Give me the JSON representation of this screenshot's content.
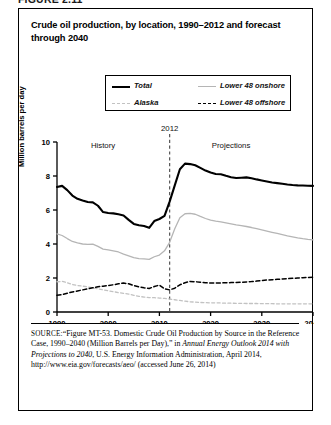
{
  "figure_label": "FIGURE 2.11",
  "title": "Crude oil production, by location, 1990–2012 and forecast through 2040",
  "legend": {
    "items": [
      {
        "label": "Total",
        "style": "solid-thick-black",
        "color": "#000000"
      },
      {
        "label": "Lower 48 onshore",
        "style": "solid-thin-gray",
        "color": "#b5b5b5"
      },
      {
        "label": "Alaska",
        "style": "dashed-light-gray",
        "color": "#c2c2c2"
      },
      {
        "label": "Lower 48 offshore",
        "style": "dashed-black",
        "color": "#000000"
      }
    ]
  },
  "annotations": {
    "history": "History",
    "projections": "Projections",
    "divider_year": "2012"
  },
  "source": {
    "prefix": "SOURCE:",
    "part1": "“Figure MT-53. Domestic Crude Oil Production by Source in the Reference Case, 1990–2040 (Million Barrels per Day),” in ",
    "italic1": "Annual Energy Outlook 2014 with Projections to 2040",
    "part2": ", U.S. Energy Information Administration, April 2014, http://www.eia.gov/forecasts/aeo/ (accessed June 26, 2014)"
  },
  "chart_data": {
    "type": "line",
    "title": "Crude oil production, by location, 1990–2012 and forecast through 2040",
    "xlabel": "",
    "ylabel": "Million barrels per day",
    "xlim": [
      1990,
      2040
    ],
    "ylim": [
      0,
      10
    ],
    "xticks": [
      1990,
      2000,
      2010,
      2020,
      2030,
      2040
    ],
    "yticks": [
      0,
      2,
      4,
      6,
      8,
      10
    ],
    "grid": false,
    "legend_position": "top",
    "vline": {
      "x": 2012,
      "label": "2012",
      "style": "dashed"
    },
    "x": [
      1990,
      1991,
      1992,
      1993,
      1994,
      1995,
      1996,
      1997,
      1998,
      1999,
      2000,
      2001,
      2002,
      2003,
      2004,
      2005,
      2006,
      2007,
      2008,
      2009,
      2010,
      2011,
      2012,
      2013,
      2014,
      2015,
      2016,
      2017,
      2018,
      2019,
      2020,
      2021,
      2022,
      2023,
      2024,
      2025,
      2026,
      2027,
      2028,
      2029,
      2030,
      2031,
      2032,
      2033,
      2034,
      2035,
      2036,
      2037,
      2038,
      2039,
      2040
    ],
    "series": [
      {
        "name": "Total",
        "color": "#000000",
        "style": "solid",
        "width": 2.1,
        "values": [
          7.35,
          7.42,
          7.17,
          6.85,
          6.66,
          6.56,
          6.47,
          6.45,
          6.25,
          5.88,
          5.82,
          5.8,
          5.75,
          5.68,
          5.42,
          5.18,
          5.1,
          5.06,
          4.95,
          5.35,
          5.47,
          5.65,
          6.49,
          7.45,
          8.4,
          8.73,
          8.7,
          8.63,
          8.48,
          8.32,
          8.2,
          8.12,
          8.1,
          8.01,
          7.93,
          7.88,
          7.9,
          7.92,
          7.87,
          7.8,
          7.74,
          7.68,
          7.62,
          7.58,
          7.54,
          7.5,
          7.47,
          7.45,
          7.44,
          7.43,
          7.42
        ]
      },
      {
        "name": "Lower 48 onshore",
        "color": "#b5b5b5",
        "style": "solid",
        "width": 1.3,
        "values": [
          4.6,
          4.5,
          4.32,
          4.15,
          4.06,
          4.0,
          3.98,
          3.99,
          3.86,
          3.7,
          3.66,
          3.6,
          3.53,
          3.4,
          3.3,
          3.2,
          3.14,
          3.12,
          3.1,
          3.25,
          3.35,
          3.6,
          4.1,
          4.9,
          5.55,
          5.78,
          5.8,
          5.75,
          5.62,
          5.5,
          5.4,
          5.34,
          5.3,
          5.24,
          5.18,
          5.12,
          5.08,
          5.03,
          4.97,
          4.9,
          4.83,
          4.76,
          4.69,
          4.62,
          4.55,
          4.48,
          4.42,
          4.36,
          4.31,
          4.27,
          4.24
        ]
      },
      {
        "name": "Alaska",
        "color": "#c2c2c2",
        "style": "dashed",
        "width": 1.3,
        "values": [
          1.78,
          1.8,
          1.72,
          1.62,
          1.56,
          1.52,
          1.48,
          1.42,
          1.36,
          1.3,
          1.25,
          1.2,
          1.14,
          1.1,
          1.05,
          0.98,
          0.92,
          0.88,
          0.85,
          0.84,
          0.82,
          0.8,
          0.76,
          0.72,
          0.68,
          0.64,
          0.6,
          0.58,
          0.56,
          0.55,
          0.54,
          0.54,
          0.53,
          0.52,
          0.52,
          0.51,
          0.51,
          0.5,
          0.5,
          0.5,
          0.49,
          0.49,
          0.49,
          0.48,
          0.48,
          0.48,
          0.48,
          0.48,
          0.48,
          0.48,
          0.48
        ]
      },
      {
        "name": "Lower 48 offshore",
        "color": "#000000",
        "style": "dashed",
        "width": 1.5,
        "values": [
          0.98,
          1.02,
          1.1,
          1.18,
          1.24,
          1.3,
          1.36,
          1.42,
          1.48,
          1.52,
          1.56,
          1.6,
          1.66,
          1.7,
          1.66,
          1.55,
          1.48,
          1.42,
          1.38,
          1.5,
          1.58,
          1.36,
          1.3,
          1.4,
          1.6,
          1.72,
          1.8,
          1.78,
          1.75,
          1.72,
          1.7,
          1.7,
          1.71,
          1.72,
          1.73,
          1.74,
          1.75,
          1.77,
          1.79,
          1.82,
          1.85,
          1.88,
          1.9,
          1.92,
          1.94,
          1.96,
          1.98,
          2.0,
          2.02,
          2.03,
          2.04
        ]
      }
    ]
  }
}
